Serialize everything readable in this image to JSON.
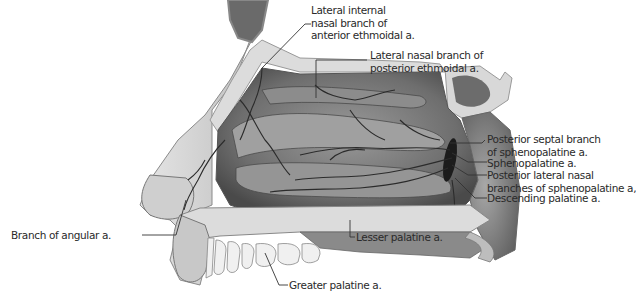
{
  "figure": {
    "colors": {
      "background": "#ffffff",
      "bone": "#d9d9d9",
      "soft_tissue": "#8a8a8a",
      "mucosa_dark": "#5a5a5a",
      "vessel": "#2b2b2b",
      "leader_line": "#333333",
      "label_text": "#2a2a2a"
    }
  },
  "labels": [
    {
      "id": "lat-int-nasal-ant-ethmoidal",
      "lines": [
        "Lateral internal",
        "nasal branch of",
        "anterior ethmoidal a."
      ]
    },
    {
      "id": "lat-nasal-post-ethmoidal",
      "lines": [
        "Lateral nasal branch of",
        "posterior ethmoidal a."
      ]
    },
    {
      "id": "post-septal-sphenopalatine",
      "lines": [
        "Posterior septal branch",
        "of sphenopalatine a."
      ]
    },
    {
      "id": "sphenopalatine",
      "lines": [
        "Sphenopalatine a."
      ]
    },
    {
      "id": "post-lat-nasal-sphenopalatine",
      "lines": [
        "Posterior lateral nasal",
        "branches of sphenopalatine a,"
      ]
    },
    {
      "id": "descending-palatine",
      "lines": [
        "Descending palatine a."
      ]
    },
    {
      "id": "branch-angular",
      "lines": [
        "Branch of angular a."
      ]
    },
    {
      "id": "lesser-palatine",
      "lines": [
        "Lesser palatine a."
      ]
    },
    {
      "id": "greater-palatine",
      "lines": [
        "Greater palatine a."
      ]
    }
  ]
}
